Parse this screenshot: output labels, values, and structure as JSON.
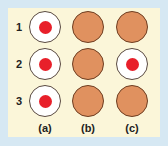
{
  "colors": {
    "border": "#d6e8f3",
    "panel": "#fbf6d9",
    "growth": "#e0915f",
    "dot": "#e8202a"
  },
  "rows": [
    "1",
    "2",
    "3"
  ],
  "columns": [
    "(a)",
    "(b)",
    "(c)"
  ],
  "grid": [
    [
      "clear",
      "growth",
      "growth"
    ],
    [
      "clear",
      "growth",
      "clear"
    ],
    [
      "clear",
      "growth",
      "growth"
    ]
  ]
}
